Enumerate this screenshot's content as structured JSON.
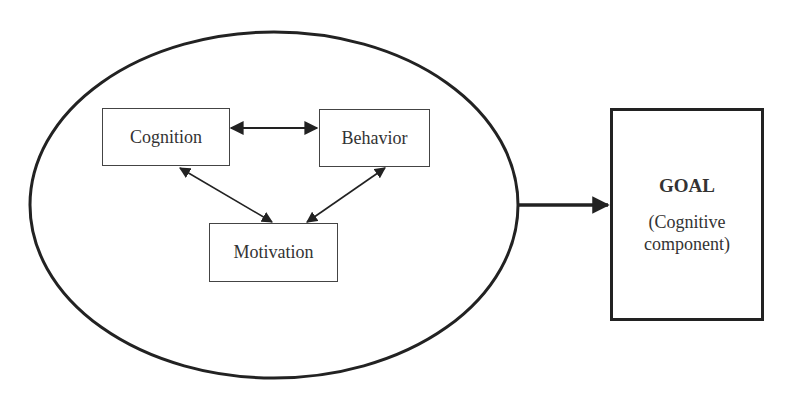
{
  "diagram": {
    "container": {
      "shape": "ellipse",
      "label": ""
    },
    "nodes": {
      "cognition": "Cognition",
      "behavior": "Behavior",
      "motivation": "Motivation"
    },
    "goal": {
      "title": "GOAL",
      "subtitle_line1": "(Cognitive",
      "subtitle_line2": "component)"
    },
    "edges": [
      {
        "from": "Cognition",
        "to": "Behavior",
        "type": "bidirectional"
      },
      {
        "from": "Cognition",
        "to": "Motivation",
        "type": "bidirectional"
      },
      {
        "from": "Behavior",
        "to": "Motivation",
        "type": "bidirectional"
      },
      {
        "from": "Ellipse",
        "to": "GOAL",
        "type": "directed"
      }
    ],
    "colors": {
      "stroke": "#222222",
      "background": "#ffffff",
      "text": "#333333"
    }
  }
}
